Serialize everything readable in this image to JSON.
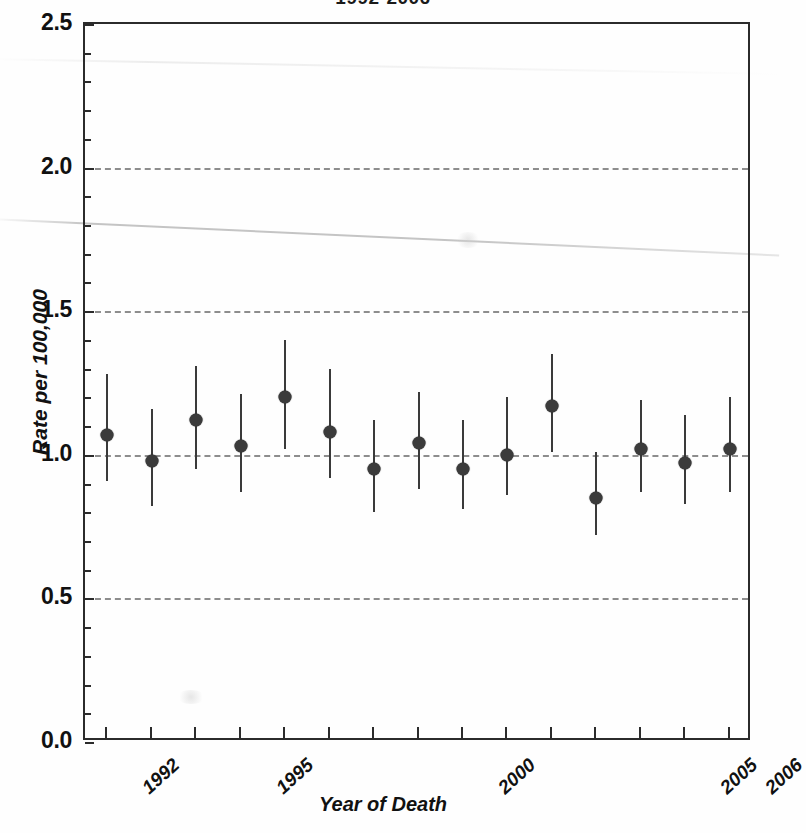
{
  "figure": {
    "title": "1992-2006",
    "y_axis_title": "Rate per 100,000",
    "x_axis_title": "Year of Death"
  },
  "chart_data": {
    "type": "scatter",
    "title": "1992-2006",
    "xlabel": "Year of Death",
    "ylabel": "Rate per 100,000",
    "xlim": [
      1991.5,
      2006.5
    ],
    "ylim": [
      0.0,
      2.5
    ],
    "grid": true,
    "gridlines_y": [
      0.5,
      1.0,
      1.5,
      2.0
    ],
    "legend": "none",
    "y_ticks_major": [
      "0.0",
      "0.5",
      "1.0",
      "1.5",
      "2.0",
      "2.5"
    ],
    "y_ticks_major_values": [
      0.0,
      0.5,
      1.0,
      1.5,
      2.0,
      2.5
    ],
    "y_ticks_minor_values": [
      0.1,
      0.2,
      0.3,
      0.4,
      0.6,
      0.7,
      0.8,
      0.9,
      1.1,
      1.2,
      1.3,
      1.4,
      1.6,
      1.7,
      1.8,
      1.9,
      2.1,
      2.2,
      2.3,
      2.4
    ],
    "x_ticks_values": [
      1992,
      1993,
      1994,
      1995,
      1996,
      1997,
      1998,
      1999,
      2000,
      2001,
      2002,
      2003,
      2004,
      2005,
      2006
    ],
    "x_tick_labels_shown": [
      {
        "value": 1992,
        "label": "1992"
      },
      {
        "value": 1995,
        "label": "1995"
      },
      {
        "value": 2000,
        "label": "2000"
      },
      {
        "value": 2005,
        "label": "2005"
      },
      {
        "value": 2006,
        "label": "2006"
      }
    ],
    "marker_color": "#3b3b3b",
    "errorbar_color": "#3a3a3a",
    "gridline_color": "#8d8d8d",
    "axis_color": "#2b2b2b",
    "x": [
      1992,
      1993,
      1994,
      1995,
      1996,
      1997,
      1998,
      1999,
      2000,
      2001,
      2002,
      2003,
      2004,
      2005,
      2006
    ],
    "values": [
      1.07,
      0.98,
      1.12,
      1.03,
      1.2,
      1.08,
      0.95,
      1.04,
      0.95,
      1.0,
      1.17,
      0.85,
      1.02,
      0.97,
      1.02
    ],
    "ci_low": [
      0.91,
      0.82,
      0.95,
      0.87,
      1.02,
      0.92,
      0.8,
      0.88,
      0.81,
      0.86,
      1.01,
      0.72,
      0.87,
      0.83,
      0.87
    ],
    "ci_high": [
      1.28,
      1.16,
      1.31,
      1.21,
      1.4,
      1.3,
      1.12,
      1.22,
      1.12,
      1.2,
      1.35,
      1.01,
      1.19,
      1.14,
      1.2
    ],
    "points": [
      {
        "year": 1992,
        "label": "1992",
        "rate": 1.07,
        "ci_low": 0.91,
        "ci_high": 1.28
      },
      {
        "year": 1993,
        "label": "1993",
        "rate": 0.98,
        "ci_low": 0.82,
        "ci_high": 1.16
      },
      {
        "year": 1994,
        "label": "1994",
        "rate": 1.12,
        "ci_low": 0.95,
        "ci_high": 1.31
      },
      {
        "year": 1995,
        "label": "1995",
        "rate": 1.03,
        "ci_low": 0.87,
        "ci_high": 1.21
      },
      {
        "year": 1996,
        "label": "1996",
        "rate": 1.2,
        "ci_low": 1.02,
        "ci_high": 1.4
      },
      {
        "year": 1997,
        "label": "1997",
        "rate": 1.08,
        "ci_low": 0.92,
        "ci_high": 1.3
      },
      {
        "year": 1998,
        "label": "1998",
        "rate": 0.95,
        "ci_low": 0.8,
        "ci_high": 1.12
      },
      {
        "year": 1999,
        "label": "1999",
        "rate": 1.04,
        "ci_low": 0.88,
        "ci_high": 1.22
      },
      {
        "year": 2000,
        "label": "2000",
        "rate": 0.95,
        "ci_low": 0.81,
        "ci_high": 1.12
      },
      {
        "year": 2001,
        "label": "2001",
        "rate": 1.0,
        "ci_low": 0.86,
        "ci_high": 1.2
      },
      {
        "year": 2002,
        "label": "2002",
        "rate": 1.17,
        "ci_low": 1.01,
        "ci_high": 1.35
      },
      {
        "year": 2003,
        "label": "2003",
        "rate": 0.85,
        "ci_low": 0.72,
        "ci_high": 1.01
      },
      {
        "year": 2004,
        "label": "2004",
        "rate": 1.02,
        "ci_low": 0.87,
        "ci_high": 1.19
      },
      {
        "year": 2005,
        "label": "2005",
        "rate": 0.97,
        "ci_low": 0.83,
        "ci_high": 1.14
      },
      {
        "year": 2006,
        "label": "2006",
        "rate": 1.02,
        "ci_low": 0.87,
        "ci_high": 1.2
      }
    ]
  }
}
